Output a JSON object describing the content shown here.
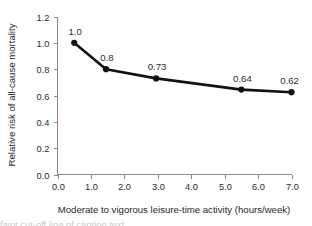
{
  "chart_data": {
    "type": "line",
    "title": "",
    "xlabel": "Moderate to vigorous leisure-time activity (hours/week)",
    "ylabel": "Relative risk of all-cause mortality",
    "xlim": [
      0.0,
      7.0
    ],
    "ylim": [
      0.0,
      1.2
    ],
    "grid": false,
    "legend": "none",
    "x_ticks": [
      "0.0",
      "1.0",
      "2.0",
      "3.0",
      "4.0",
      "5.0",
      "6.0",
      "7.0"
    ],
    "x_tick_values": [
      0.0,
      1.0,
      2.0,
      3.0,
      4.0,
      5.0,
      6.0,
      7.0
    ],
    "y_ticks": [
      "0.0",
      "0.2",
      "0.4",
      "0.6",
      "0.8",
      "1.0",
      "1.2"
    ],
    "y_tick_values": [
      0.0,
      0.2,
      0.4,
      0.6,
      0.8,
      1.0,
      1.2
    ],
    "x": [
      0.5,
      1.45,
      2.95,
      5.5,
      7.0
    ],
    "values": [
      1.0,
      0.8,
      0.73,
      0.645,
      0.625
    ],
    "point_labels": [
      "1.0",
      "0.8",
      "0.73",
      "0.64",
      "0.62"
    ],
    "series": [
      {
        "name": "Relative risk",
        "x": [
          0.5,
          1.45,
          2.95,
          5.5,
          7.0
        ],
        "values": [
          1.0,
          0.8,
          0.73,
          0.645,
          0.625
        ],
        "labels": [
          "1.0",
          "0.8",
          "0.73",
          "0.64",
          "0.62"
        ],
        "color": "#111111",
        "marker": "filled-circle"
      }
    ],
    "axis_color": "#8a8a8a",
    "line_color": "#111111"
  },
  "caption": {
    "partial_text": "faint cut-off line of caption text"
  }
}
